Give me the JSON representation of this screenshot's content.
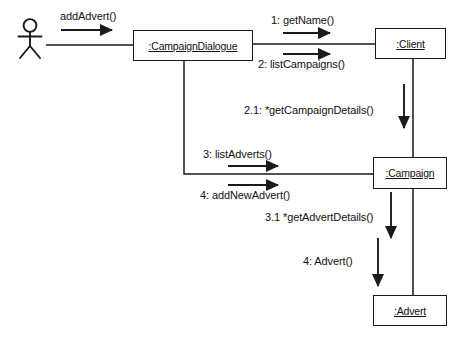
{
  "diagram": {
    "type": "uml-collaboration-diagram",
    "title": "",
    "background_color": "#ffffff",
    "line_color": "#1a1a1a",
    "text_color": "#111111"
  },
  "actor": {
    "name": "actor-stick-figure",
    "label": ""
  },
  "objects": [
    {
      "id": "campaign-dialogue",
      "label": ":CampaignDialogue",
      "x": 133,
      "y": 30,
      "w": 120,
      "h": 31
    },
    {
      "id": "client",
      "label": ":Client",
      "x": 375,
      "y": 28,
      "w": 71,
      "h": 31
    },
    {
      "id": "campaign",
      "label": ":Campaign",
      "x": 373,
      "y": 157,
      "w": 74,
      "h": 32
    },
    {
      "id": "advert",
      "label": ":Advert",
      "x": 373,
      "y": 295,
      "w": 74,
      "h": 31
    }
  ],
  "messages": [
    {
      "id": "m0",
      "label": "addAdvert()",
      "from": "actor",
      "to": "campaign-dialogue",
      "direction": "right"
    },
    {
      "id": "m1",
      "label": "1: getName()",
      "from": "campaign-dialogue",
      "to": "client",
      "direction": "right"
    },
    {
      "id": "m2",
      "label": "2: listCampaigns()",
      "from": "campaign-dialogue",
      "to": "client",
      "direction": "right"
    },
    {
      "id": "m21",
      "label": "2.1: *getCampaignDetails()",
      "from": "client",
      "to": "campaign",
      "direction": "down"
    },
    {
      "id": "m3",
      "label": "3: listAdverts()",
      "from": "campaign-dialogue",
      "to": "campaign",
      "direction": "right"
    },
    {
      "id": "m4",
      "label": "4: addNewAdvert()",
      "from": "campaign-dialogue",
      "to": "campaign",
      "direction": "right"
    },
    {
      "id": "m31",
      "label": "3.1 *getAdvertDetails()",
      "from": "campaign",
      "to": "advert",
      "direction": "down"
    },
    {
      "id": "m4a",
      "label": "4: Advert()",
      "from": "campaign",
      "to": "advert",
      "direction": "down"
    }
  ],
  "links": [
    {
      "id": "l-actor-dialogue",
      "from": "actor",
      "to": "campaign-dialogue"
    },
    {
      "id": "l-dialogue-client",
      "from": "campaign-dialogue",
      "to": "client"
    },
    {
      "id": "l-dialogue-campaign",
      "from": "campaign-dialogue",
      "to": "campaign"
    },
    {
      "id": "l-client-campaign",
      "from": "client",
      "to": "campaign"
    },
    {
      "id": "l-campaign-advert",
      "from": "campaign",
      "to": "advert"
    }
  ]
}
